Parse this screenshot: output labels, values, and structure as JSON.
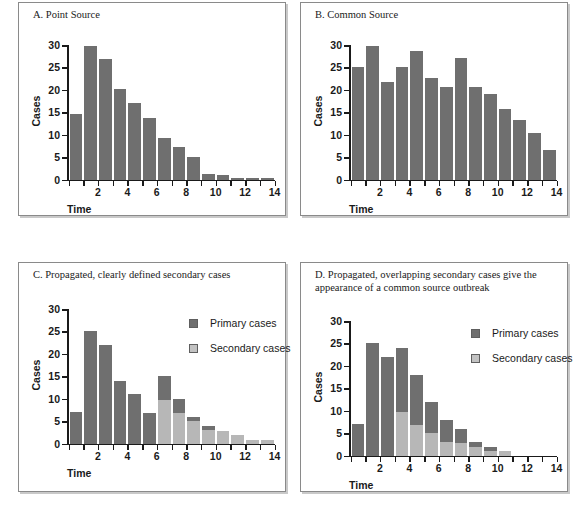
{
  "figure": {
    "panels": [
      {
        "id": "a",
        "title": "A. Point Source",
        "xlabel": "Time",
        "ylabel": "Cases"
      },
      {
        "id": "b",
        "title": "B. Common Source",
        "xlabel": "Time",
        "ylabel": "Cases"
      },
      {
        "id": "c",
        "title": "C. Propagated, clearly defined secondary cases",
        "xlabel": "Time",
        "ylabel": "Cases"
      },
      {
        "id": "d",
        "title": "D. Propagated, overlapping secondary cases give the appearance of a common source outbreak",
        "xlabel": "Time",
        "ylabel": "Cases"
      }
    ],
    "legend": {
      "primary_label": "Primary cases",
      "secondary_label": "Secondary cases",
      "primary_color": "#6f6f6f",
      "secondary_color": "#b7b7b7"
    },
    "yticks": [
      "0",
      "5",
      "10",
      "15",
      "20",
      "25",
      "30"
    ],
    "xticks": [
      "2",
      "4",
      "6",
      "8",
      "10",
      "12",
      "14"
    ]
  },
  "chart_data": [
    {
      "type": "bar",
      "title": "A. Point Source",
      "xlabel": "Time",
      "ylabel": "Cases",
      "ylim": [
        0,
        30
      ],
      "grid": false,
      "legend": "none",
      "categories": [
        1,
        2,
        3,
        4,
        5,
        6,
        7,
        8,
        9,
        10,
        11,
        12,
        13,
        14
      ],
      "xtick_labels": [
        "2",
        "4",
        "6",
        "8",
        "10",
        "12",
        "14"
      ],
      "ytick_labels": [
        "0",
        "5",
        "10",
        "15",
        "20",
        "25",
        "30"
      ],
      "values": [
        14.7,
        29.7,
        26.8,
        20.2,
        17.1,
        13.7,
        9.2,
        7.2,
        5.0,
        1.2,
        0.9,
        0.4,
        0.3,
        0.3
      ]
    },
    {
      "type": "bar",
      "title": "B. Common Source",
      "xlabel": "Time",
      "ylabel": "Cases",
      "ylim": [
        0,
        30
      ],
      "grid": false,
      "legend": "none",
      "categories": [
        1,
        2,
        3,
        4,
        5,
        6,
        7,
        8,
        9,
        10,
        11,
        12,
        13,
        14
      ],
      "xtick_labels": [
        "2",
        "4",
        "6",
        "8",
        "10",
        "12",
        "14"
      ],
      "ytick_labels": [
        "0",
        "5",
        "10",
        "15",
        "20",
        "25",
        "30"
      ],
      "values": [
        25.0,
        29.8,
        21.7,
        25.0,
        28.7,
        22.7,
        20.6,
        27.0,
        20.6,
        19.0,
        15.7,
        13.3,
        10.4,
        6.5
      ]
    },
    {
      "type": "bar",
      "title": "C. Propagated, clearly defined secondary cases",
      "xlabel": "Time",
      "ylabel": "Cases",
      "ylim": [
        0,
        30
      ],
      "grid": false,
      "legend": "upper right",
      "stacked": true,
      "categories": [
        1,
        2,
        3,
        4,
        5,
        6,
        7,
        8,
        9,
        10,
        11,
        12,
        13,
        14
      ],
      "xtick_labels": [
        "2",
        "4",
        "6",
        "8",
        "10",
        "12",
        "14"
      ],
      "ytick_labels": [
        "0",
        "5",
        "10",
        "15",
        "20",
        "25",
        "30"
      ],
      "series": [
        {
          "name": "Secondary cases",
          "color": "#b7b7b7",
          "values": [
            0,
            0,
            0,
            0,
            0,
            0,
            9.7,
            6.8,
            5.0,
            3.0,
            2.9,
            1.9,
            0.7,
            0.7
          ]
        },
        {
          "name": "Primary cases",
          "color": "#6f6f6f",
          "values": [
            7.0,
            25.0,
            22.0,
            14.0,
            11.0,
            6.9,
            5.3,
            3.1,
            0.9,
            0.9,
            0,
            0,
            0,
            0
          ]
        }
      ]
    },
    {
      "type": "bar",
      "title": "D. Propagated, overlapping secondary cases give the appearance of a common source outbreak",
      "xlabel": "Time",
      "ylabel": "Cases",
      "ylim": [
        0,
        30
      ],
      "grid": false,
      "legend": "upper right",
      "stacked": true,
      "categories": [
        1,
        2,
        3,
        4,
        5,
        6,
        7,
        8,
        9,
        10,
        11,
        12,
        13,
        14
      ],
      "xtick_labels": [
        "2",
        "4",
        "6",
        "8",
        "10",
        "12",
        "14"
      ],
      "ytick_labels": [
        "0",
        "5",
        "10",
        "15",
        "20",
        "25",
        "30"
      ],
      "series": [
        {
          "name": "Secondary cases",
          "color": "#b7b7b7",
          "values": [
            0,
            0,
            0,
            9.8,
            6.8,
            5.0,
            3.0,
            2.8,
            2.0,
            1.0,
            0.9,
            0,
            0,
            0
          ]
        },
        {
          "name": "Primary cases",
          "color": "#6f6f6f",
          "values": [
            7.0,
            25.0,
            22.0,
            14.1,
            11.1,
            7.0,
            5.0,
            3.2,
            1.0,
            1.0,
            0,
            0,
            0,
            0
          ]
        }
      ]
    }
  ]
}
